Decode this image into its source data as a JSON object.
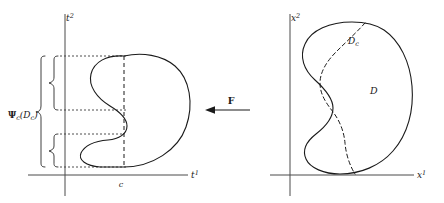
{
  "figure": {
    "background_color": "#ffffff",
    "curve_color": "#1a1a1a",
    "axis_color": "#4a4a4a",
    "width": 444,
    "height": 203
  },
  "left_panel": {
    "name": "t-space plot",
    "axes": {
      "horizontal_label": "t",
      "horizontal_superscript": "1",
      "vertical_label": "t",
      "vertical_superscript": "2"
    },
    "tick": {
      "label": "c",
      "axis": "horizontal"
    },
    "brace_label": {
      "symbol": "Ψ",
      "subscript": "c",
      "argument_open": "(",
      "argument_symbol": "D",
      "argument_subscript": "c",
      "argument_close": ")",
      "full_text": "Ψc(Dc)"
    },
    "region_description": "kidney-shaped region with S-curve indentation on the left side",
    "projection_bands": [
      {
        "name": "upper-band",
        "top": 56,
        "bottom": 110
      },
      {
        "name": "lower-band",
        "top": 134,
        "bottom": 167
      }
    ]
  },
  "arrow": {
    "name": "mapping-arrow",
    "label": "F",
    "direction": "left",
    "description": "arrow pointing from right panel to left panel labeled F"
  },
  "right_panel": {
    "name": "x-space plot",
    "axes": {
      "horizontal_label": "x",
      "horizontal_superscript": "1",
      "vertical_label": "x",
      "vertical_superscript": "2"
    },
    "region_label": {
      "symbol": "D",
      "full_text": "D"
    },
    "slice_label": {
      "symbol": "D",
      "subscript": "c",
      "full_text": "Dc"
    },
    "region_description": "kidney-shaped region D with dashed interior curve marking the slice Dc"
  }
}
